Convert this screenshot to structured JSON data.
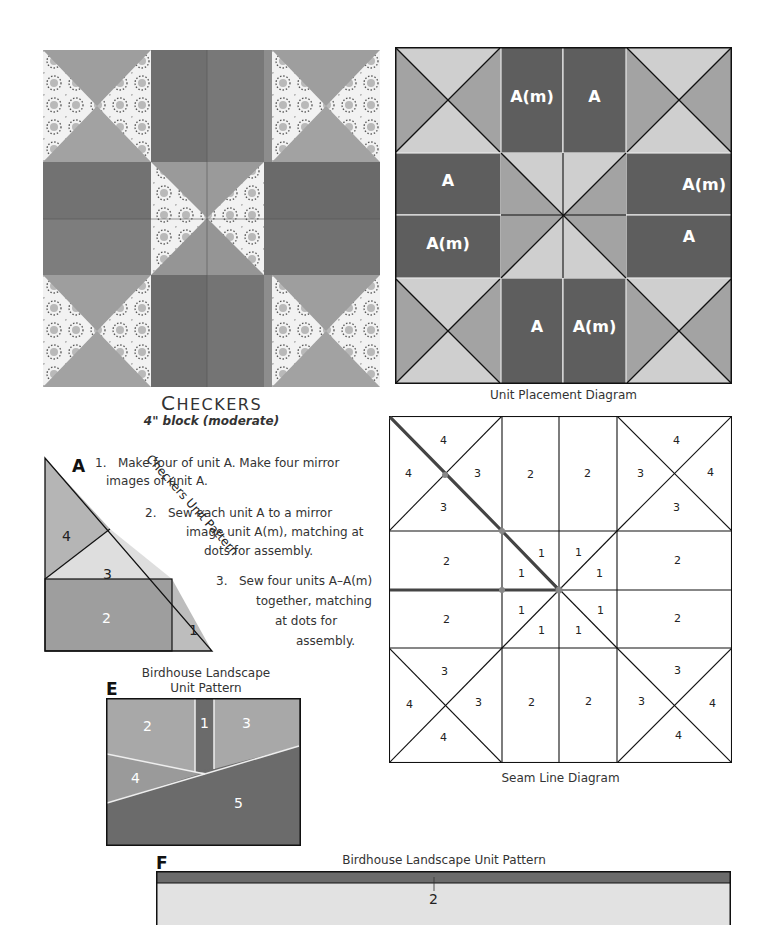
{
  "block": {
    "title_first": "C",
    "title_rest": "HECKERS",
    "subtitle": "4\" block (moderate)"
  },
  "unit_placement": {
    "caption": "Unit Placement Diagram",
    "labels": {
      "top_left": "A(m)",
      "top_right": "A",
      "left_top": "A",
      "left_bottom": "A(m)",
      "right_top": "A(m)",
      "right_bottom": "A",
      "bottom_left": "A",
      "bottom_right": "A(m)"
    },
    "colors": {
      "dark": "#5e5e5e",
      "medium": "#a3a3a3",
      "light": "#cfcfcf"
    }
  },
  "unit_a": {
    "letter": "A",
    "pattern_label": "Checkers Unit Pattern",
    "pieces": [
      "1",
      "2",
      "3",
      "4"
    ]
  },
  "steps": [
    {
      "num": "1.",
      "line1": "Make four of unit A. Make four mirror",
      "line2": "images of unit A."
    },
    {
      "num": "2.",
      "line1": "Sew each unit A to a mirror",
      "line2": "image unit A(m), matching at",
      "line3": "dots for assembly."
    },
    {
      "num": "3.",
      "line1": "Sew four units A–A(m)",
      "line2": "together, matching",
      "line3": "at dots for",
      "line4": "assembly."
    }
  ],
  "seam_line": {
    "caption": "Seam Line Diagram",
    "n1": "1",
    "n2": "2",
    "n3": "3",
    "n4": "4"
  },
  "unit_e": {
    "letter": "E",
    "title_line1": "Birdhouse Landscape",
    "title_line2": "Unit Pattern",
    "pieces": [
      "1",
      "2",
      "3",
      "4",
      "5"
    ]
  },
  "unit_f": {
    "letter": "F",
    "title": "Birdhouse Landscape Unit Pattern",
    "piece": "2"
  }
}
